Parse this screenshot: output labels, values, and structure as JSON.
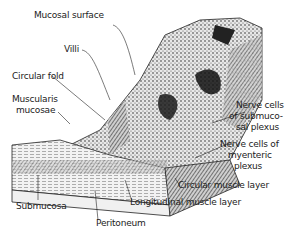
{
  "figure": {
    "labels": {
      "mucosal_surface": "Mucosal surface",
      "villi": "Villi",
      "circular_fold": "Circular fold",
      "muscularis_mucosae_1": "Muscularis",
      "muscularis_mucosae_2": "mucosae",
      "nerve_submucosal_1": "Nerve cells",
      "nerve_submucosal_2": "of submuco-",
      "nerve_submucosal_3": "sal plexus",
      "nerve_myenteric_1": "Nerve cells of",
      "nerve_myenteric_2": "myenteric",
      "nerve_myenteric_3": "plexus",
      "circular_muscle": "Circular muscle layer",
      "longitudinal_muscle": "Longitudinal muscle layer",
      "submucosa": "Submucosa",
      "peritoneum": "Peritoneum"
    }
  }
}
